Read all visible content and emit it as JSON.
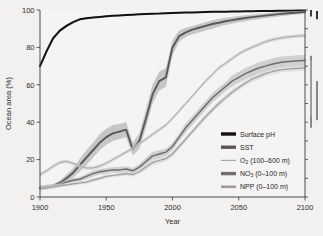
{
  "chart_data": {
    "type": "line",
    "title": "",
    "xlabel": "Year",
    "ylabel": "Ocean area (%)",
    "xlim": [
      1900,
      2100
    ],
    "ylim": [
      0,
      100
    ],
    "xticks": [
      "1900",
      "1950",
      "2000",
      "2050",
      "2100"
    ],
    "yticks": [
      "0",
      "20",
      "40",
      "60",
      "80",
      "100"
    ],
    "grid": false,
    "legend_position": "lower-right",
    "x": [
      1900,
      1905,
      1910,
      1915,
      1920,
      1925,
      1930,
      1935,
      1940,
      1945,
      1950,
      1955,
      1960,
      1965,
      1970,
      1975,
      1980,
      1985,
      1990,
      1995,
      2000,
      2005,
      2010,
      2015,
      2020,
      2025,
      2030,
      2035,
      2040,
      2045,
      2050,
      2055,
      2060,
      2065,
      2070,
      2075,
      2080,
      2085,
      2090,
      2095,
      2100
    ],
    "series": [
      {
        "name": "Surface pH",
        "label": "Surface pH",
        "color": "#111111",
        "band_color": "#9a9a9a",
        "linewidth": 2.0,
        "values": [
          70,
          78,
          85,
          89,
          91.5,
          93.5,
          95,
          95.6,
          96,
          96.3,
          96.6,
          96.9,
          97.1,
          97.3,
          97.5,
          97.7,
          97.9,
          98.0,
          98.1,
          98.3,
          98.4,
          98.5,
          98.6,
          98.7,
          98.8,
          98.9,
          99.0,
          99.05,
          99.1,
          99.2,
          99.25,
          99.3,
          99.35,
          99.4,
          99.45,
          99.5,
          99.55,
          99.6,
          99.65,
          99.7,
          99.75
        ],
        "band_lower": [
          69,
          77,
          84,
          88.2,
          90.8,
          93,
          94.6,
          95.2,
          95.7,
          96,
          96.3,
          96.6,
          96.8,
          97,
          97.2,
          97.4,
          97.6,
          97.8,
          97.9,
          98.1,
          98.2,
          98.3,
          98.4,
          98.5,
          98.6,
          98.7,
          98.8,
          98.9,
          99.0,
          99.05,
          99.1,
          99.15,
          99.2,
          99.25,
          99.3,
          99.35,
          99.4,
          99.45,
          99.5,
          99.55,
          99.6
        ],
        "band_upper": [
          71,
          79,
          86,
          89.8,
          92.2,
          94,
          95.4,
          96,
          96.3,
          96.6,
          96.9,
          97.2,
          97.4,
          97.6,
          97.8,
          98,
          98.2,
          98.2,
          98.3,
          98.5,
          98.6,
          98.7,
          98.8,
          98.9,
          99,
          99.1,
          99.2,
          99.2,
          99.2,
          99.35,
          99.4,
          99.45,
          99.5,
          99.55,
          99.6,
          99.65,
          99.7,
          99.75,
          99.8,
          99.85,
          99.9
        ]
      },
      {
        "name": "SST",
        "label": "SST",
        "color": "#585858",
        "band_color": "#b4b4b4",
        "linewidth": 1.9,
        "values": [
          5,
          5.5,
          6,
          7.5,
          10,
          13,
          17,
          21,
          25,
          29,
          32,
          34,
          35,
          36,
          25.5,
          30,
          42,
          55,
          62,
          64,
          80,
          86,
          88,
          89.5,
          90.5,
          91.5,
          92.5,
          93.2,
          94,
          94.6,
          95.2,
          95.7,
          96.2,
          96.6,
          97,
          97.4,
          97.8,
          98.1,
          98.4,
          98.7,
          99
        ],
        "band_lower": [
          4,
          4.5,
          5,
          6.2,
          8,
          10.5,
          13.5,
          17,
          21,
          25,
          28,
          30,
          31,
          32,
          22,
          26,
          37,
          50,
          57,
          59,
          76,
          83,
          85.5,
          87,
          88,
          89,
          90,
          91,
          92,
          92.7,
          93.4,
          94,
          94.6,
          95.1,
          95.6,
          96,
          96.5,
          96.9,
          97.3,
          97.7,
          98
        ],
        "band_upper": [
          6,
          6.5,
          7,
          8.8,
          12,
          15.5,
          20.5,
          25,
          29,
          33.5,
          36.5,
          38.5,
          39,
          40,
          29,
          34,
          47,
          60,
          67,
          69,
          84,
          89,
          90.5,
          91.5,
          92.5,
          93.5,
          94.5,
          95.2,
          95.8,
          96.3,
          96.8,
          97.2,
          97.6,
          98,
          98.3,
          98.6,
          98.9,
          99.1,
          99.3,
          99.5,
          99.7
        ]
      },
      {
        "name": "O2 (100-600 m)",
        "label": "O",
        "label_sub": "2",
        "label_rest": " (100–600 m)",
        "color": "#a6a6a6",
        "band_color": "#d2d2d2",
        "linewidth": 1.0,
        "values": [
          12,
          14,
          16.5,
          18.5,
          19,
          18,
          16.5,
          15.5,
          15.5,
          16.5,
          18,
          20,
          22,
          24,
          26,
          28.5,
          31,
          33.5,
          36,
          38.5,
          42,
          46,
          50,
          54,
          58,
          62,
          65.5,
          69,
          71.5,
          74,
          76.5,
          78.5,
          80,
          81.5,
          83,
          84,
          84.8,
          85.4,
          85.8,
          86.1,
          86.3
        ],
        "band_lower": [
          11,
          13,
          15.5,
          17.5,
          18,
          17,
          15.5,
          14.5,
          14.5,
          15.5,
          17,
          19,
          21,
          23,
          25,
          27.5,
          30,
          32.5,
          35,
          37.5,
          41,
          45,
          49,
          53,
          57,
          61,
          64.5,
          68,
          70.5,
          73,
          75.5,
          77.5,
          79,
          80.5,
          82,
          83,
          83.8,
          84.4,
          84.8,
          85.1,
          85.3
        ],
        "band_upper": [
          13,
          15,
          17.5,
          19.5,
          20,
          19,
          17.5,
          16.5,
          16.5,
          17.5,
          19,
          21,
          23,
          25,
          27,
          29.5,
          32,
          34.5,
          37,
          39.5,
          43,
          47,
          51,
          55,
          59,
          63,
          66.5,
          70,
          72.5,
          75,
          77.5,
          79.5,
          81,
          82.5,
          84,
          85,
          85.8,
          86.4,
          86.8,
          87.1,
          87.3
        ]
      },
      {
        "name": "NO3 (0-100 m)",
        "label": "NO",
        "label_sub": "3",
        "label_rest": " (0–100 m)",
        "color": "#6e6e6e",
        "band_color": "#c2c2c2",
        "linewidth": 1.5,
        "values": [
          4.5,
          5,
          5.5,
          6.5,
          8,
          9,
          9.5,
          11,
          12.5,
          13.5,
          14,
          14.5,
          14.5,
          15,
          14,
          16,
          19,
          22,
          23,
          24,
          27,
          32,
          37,
          41,
          45,
          49,
          53,
          56,
          59,
          62,
          64,
          66,
          67.5,
          69,
          70,
          71,
          71.8,
          72.3,
          72.6,
          72.8,
          73
        ],
        "band_lower": [
          3.5,
          4,
          4.5,
          5.5,
          6.8,
          7.8,
          8.3,
          9.5,
          11,
          12,
          12.5,
          13,
          13,
          13.5,
          12.5,
          14.5,
          17,
          20,
          21,
          22,
          25,
          30,
          34.5,
          38.5,
          42.5,
          46.5,
          50.5,
          53.5,
          56.5,
          59,
          61,
          63,
          64.5,
          66,
          67,
          68,
          68.8,
          69.3,
          69.6,
          69.8,
          70
        ],
        "band_upper": [
          5.5,
          6,
          6.5,
          7.5,
          9.2,
          10.2,
          10.7,
          12.5,
          14,
          15,
          15.5,
          16,
          16,
          16.5,
          15.5,
          17.5,
          21,
          24,
          25,
          26,
          29,
          34,
          39.5,
          43.5,
          47.5,
          51.5,
          55.5,
          58.5,
          61.5,
          65,
          67,
          69,
          70.5,
          72,
          73,
          74,
          74.8,
          75.3,
          75.6,
          75.8,
          76
        ]
      },
      {
        "name": "NPP (0-100 m)",
        "label": "NPP (0–100 m)",
        "color": "#9c9c9c",
        "band_color": "#d8d8d8",
        "linewidth": 1.2,
        "values": [
          4.5,
          5,
          5.5,
          6,
          6.5,
          7,
          7.5,
          8,
          9,
          10,
          11,
          11.5,
          12,
          12.5,
          12,
          13.5,
          16,
          18.5,
          19.5,
          20.5,
          23,
          27,
          31,
          35,
          39,
          43,
          46.5,
          50,
          53,
          56,
          58.5,
          61,
          63,
          64.5,
          66,
          67,
          67.8,
          68.3,
          68.6,
          68.8,
          69
        ],
        "band_lower": [
          3.5,
          4,
          4.5,
          5,
          5.5,
          6,
          6.5,
          7,
          8,
          9,
          10,
          10.5,
          11,
          11.5,
          11,
          12.5,
          14.5,
          17,
          18,
          19,
          21.5,
          25.5,
          29.5,
          33.5,
          37.5,
          41.5,
          45,
          48.5,
          51.5,
          54.5,
          57,
          59.5,
          61.5,
          63,
          64.5,
          65.5,
          66.3,
          66.8,
          67.1,
          67.3,
          67.5
        ],
        "band_upper": [
          5.5,
          6,
          6.5,
          7,
          7.5,
          8,
          8.5,
          9,
          10,
          11,
          12,
          12.5,
          13,
          13.5,
          13,
          14.5,
          17.5,
          20,
          21,
          22,
          24.5,
          28.5,
          32.5,
          36.5,
          40.5,
          44.5,
          48,
          51.5,
          54.5,
          57.5,
          60,
          62.5,
          64.5,
          66,
          67.5,
          68.5,
          69.3,
          69.8,
          70.1,
          70.3,
          70.5
        ]
      }
    ],
    "error_bars": [
      {
        "name": "surface-ph-uncertainty",
        "x_offset": 6,
        "low": 96.5,
        "high": 100.0,
        "color": "#111111",
        "width": 1.6
      },
      {
        "name": "sst-uncertainty",
        "x_offset": 6,
        "low": 37.0,
        "high": 75.5,
        "color": "#6e6e6e",
        "width": 1.6
      },
      {
        "name": "o2-uncertainty",
        "x_offset": 6,
        "low": 43.0,
        "high": 73.0,
        "color": "#a6a6a6",
        "width": 1.4
      },
      {
        "name": "no3-uncertainty",
        "x_offset": 12,
        "low": 41.0,
        "high": 62.0,
        "color": "#7a7a7a",
        "width": 1.8
      },
      {
        "name": "npp-uncertainty",
        "x_offset": 12,
        "low": 95.0,
        "high": 99.5,
        "color": "#1a1a1a",
        "width": 1.8
      }
    ]
  },
  "figure": {
    "background": "#f2f1ef",
    "plot_background": "#f5f4f2",
    "axis_color": "#3a3a3a"
  }
}
